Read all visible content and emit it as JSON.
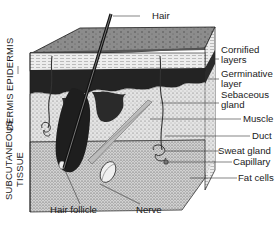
{
  "figure": {
    "layers_left": [
      {
        "label": "EPIDERMIS"
      },
      {
        "label": "DERMIS"
      },
      {
        "label": "SUBCUTANEOUS",
        "label2": "TISSUE"
      }
    ],
    "labels_right": [
      {
        "label": "Cornified",
        "label2": "layers"
      },
      {
        "label": "Germinative",
        "label2": "layer"
      },
      {
        "label": "Sebaceous",
        "label2": "gland"
      },
      {
        "label": "Muscle"
      },
      {
        "label": "Duct"
      },
      {
        "label": "Sweat gland"
      },
      {
        "label": "Capillary"
      },
      {
        "label": "Fat cells"
      }
    ],
    "labels_top": [
      {
        "label": "Hair"
      }
    ],
    "labels_bottom": [
      {
        "label": "Hair follicle"
      },
      {
        "label": "Nerve"
      }
    ],
    "colors": {
      "ink": "#1a1a1a",
      "top_face": "#8a8a8a",
      "cornified": "#e6e6e6",
      "germinative": "#2a2a2a",
      "dermis": "#dcdcdc",
      "subcutaneous": "#cfcfcf",
      "background": "#ffffff"
    }
  }
}
